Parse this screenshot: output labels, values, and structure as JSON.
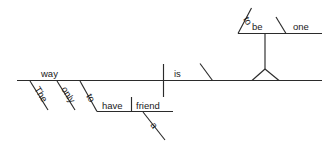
{
  "diagram": {
    "type": "reed-kellogg-sentence-diagram",
    "sentence": "The only way is to have a friend to be one.",
    "ink_color": "#2b2b2b",
    "background_color": "#ffffff",
    "main_clause": {
      "subject": "way",
      "subject_modifiers": [
        "The",
        "only"
      ],
      "verb": "is",
      "predicate_nominative_phrase": {
        "infinitive_marker": "to",
        "infinitive_verb": "have",
        "object": "friend",
        "object_modifier": "a"
      }
    },
    "elevated_phrase": {
      "infinitive_marker": "to",
      "infinitive_verb": "be",
      "predicate_nominative": "one"
    },
    "words": {
      "the": "The",
      "only": "only",
      "way": "way",
      "is": "is",
      "to_have_marker": "to",
      "have": "have",
      "a": "a",
      "friend": "friend",
      "to_be_marker": "to",
      "be": "be",
      "one": "one"
    }
  }
}
